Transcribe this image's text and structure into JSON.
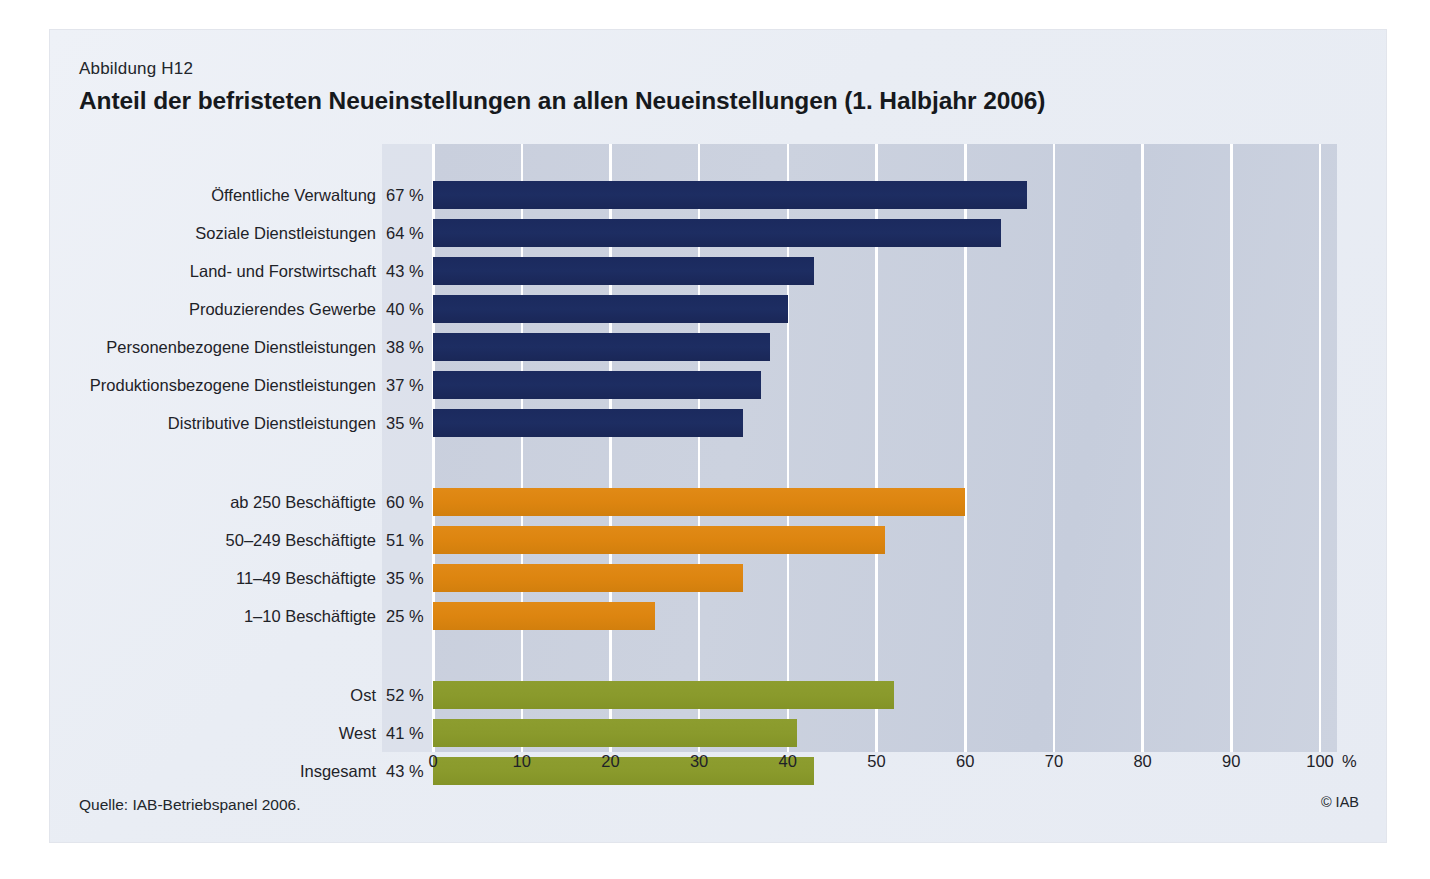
{
  "figure": {
    "number": "Abbildung H12",
    "title": "Anteil der befristeten Neueinstellungen an allen Neueinstellungen (1. Halbjahr 2006)",
    "source": "Quelle: IAB-Betriebspanel 2006.",
    "copyright": "© IAB"
  },
  "axis": {
    "unit": "%",
    "ticks": [
      "0",
      "10",
      "20",
      "30",
      "40",
      "50",
      "60",
      "70",
      "80",
      "90",
      "100"
    ]
  },
  "colors": {
    "blue": "#1d2d5e",
    "orange": "#dd8510",
    "green": "#8a9a2c",
    "panel_background": "#c9cfdd",
    "page_background": "#e9edf4",
    "gridline": "#ffffff"
  },
  "rows": [
    {
      "label": "Öffentliche Verwaltung",
      "value_text": "67 %",
      "value": 67,
      "color": "blue"
    },
    {
      "label": "Soziale Dienstleistungen",
      "value_text": "64 %",
      "value": 64,
      "color": "blue"
    },
    {
      "label": "Land- und Forstwirtschaft",
      "value_text": "43 %",
      "value": 43,
      "color": "blue"
    },
    {
      "label": "Produzierendes Gewerbe",
      "value_text": "40 %",
      "value": 40,
      "color": "blue"
    },
    {
      "label": "Personenbezogene Dienstleistungen",
      "value_text": "38 %",
      "value": 38,
      "color": "blue"
    },
    {
      "label": "Produktionsbezogene Dienstleistungen",
      "value_text": "37 %",
      "value": 37,
      "color": "blue"
    },
    {
      "label": "Distributive Dienstleistungen",
      "value_text": "35 %",
      "value": 35,
      "color": "blue"
    },
    {
      "label": "ab 250 Beschäftigte",
      "value_text": "60 %",
      "value": 60,
      "color": "orange"
    },
    {
      "label": "50–249 Beschäftigte",
      "value_text": "51 %",
      "value": 51,
      "color": "orange"
    },
    {
      "label": "11–49 Beschäftigte",
      "value_text": "35 %",
      "value": 35,
      "color": "orange"
    },
    {
      "label": "1–10 Beschäftigte",
      "value_text": "25 %",
      "value": 25,
      "color": "orange"
    },
    {
      "label": "Ost",
      "value_text": "52 %",
      "value": 52,
      "color": "green"
    },
    {
      "label": "West",
      "value_text": "41 %",
      "value": 41,
      "color": "green"
    },
    {
      "label": "Insgesamt",
      "value_text": "43 %",
      "value": 43,
      "color": "green"
    }
  ],
  "chart_data": {
    "type": "bar",
    "orientation": "horizontal",
    "title": "Anteil der befristeten Neueinstellungen an allen Neueinstellungen (1. Halbjahr 2006)",
    "subtitle": "Abbildung H12",
    "xlabel": "%",
    "ylabel": "",
    "xlim": [
      0,
      100
    ],
    "xticks": [
      0,
      10,
      20,
      30,
      40,
      50,
      60,
      70,
      80,
      90,
      100
    ],
    "grid": "vertical",
    "legend": "none",
    "source": "Quelle: IAB-Betriebspanel 2006.",
    "groups": [
      {
        "name": "Branche",
        "color": "#1d2d5e",
        "categories": [
          "Öffentliche Verwaltung",
          "Soziale Dienstleistungen",
          "Land- und Forstwirtschaft",
          "Produzierendes Gewerbe",
          "Personenbezogene Dienstleistungen",
          "Produktionsbezogene Dienstleistungen",
          "Distributive Dienstleistungen"
        ],
        "values": [
          67,
          64,
          43,
          40,
          38,
          37,
          35
        ]
      },
      {
        "name": "Betriebsgröße",
        "color": "#dd8510",
        "categories": [
          "ab 250 Beschäftigte",
          "50–249 Beschäftigte",
          "11–49 Beschäftigte",
          "1–10 Beschäftigte"
        ],
        "values": [
          60,
          51,
          35,
          25
        ]
      },
      {
        "name": "Region",
        "color": "#8a9a2c",
        "categories": [
          "Ost",
          "West",
          "Insgesamt"
        ],
        "values": [
          52,
          41,
          43
        ]
      }
    ],
    "categories": [
      "Öffentliche Verwaltung",
      "Soziale Dienstleistungen",
      "Land- und Forstwirtschaft",
      "Produzierendes Gewerbe",
      "Personenbezogene Dienstleistungen",
      "Produktionsbezogene Dienstleistungen",
      "Distributive Dienstleistungen",
      "ab 250 Beschäftigte",
      "50–249 Beschäftigte",
      "11–49 Beschäftigte",
      "1–10 Beschäftigte",
      "Ost",
      "West",
      "Insgesamt"
    ],
    "values": [
      67,
      64,
      43,
      40,
      38,
      37,
      35,
      60,
      51,
      35,
      25,
      52,
      41,
      43
    ]
  }
}
